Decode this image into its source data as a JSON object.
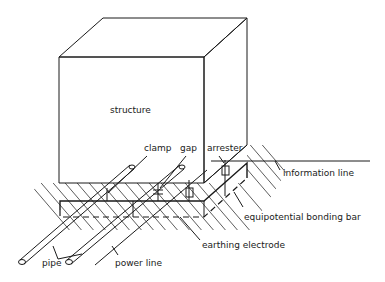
{
  "diagram": {
    "labels": {
      "structure": "structure",
      "clamp": "clamp",
      "gap": "gap",
      "arrester": "arrester",
      "information_line": "information line",
      "equipotential_bonding_bar": "equipotential bonding bar",
      "earthing_electrode": "earthing electrode",
      "pipe": "pipe",
      "power_line": "power line"
    },
    "colors": {
      "line": "#1a1a1a",
      "background": "#ffffff"
    }
  }
}
